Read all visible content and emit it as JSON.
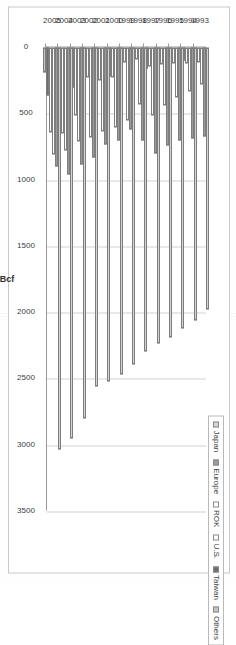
{
  "chart_data": {
    "type": "bar",
    "orientation": "horizontal-grouped",
    "title": "",
    "xlabel": "Bcf",
    "ylabel": "",
    "axis_title": "Bcf",
    "xlim": [
      0,
      3500
    ],
    "xticks": [
      0,
      500,
      1000,
      1500,
      2000,
      2500,
      3000,
      3500
    ],
    "xticklabels": [
      "0",
      "500",
      "1000",
      "1500",
      "2000",
      "2500",
      "3000",
      "3500"
    ],
    "grid": true,
    "axis_reversed": true,
    "legend_position": "top-right",
    "categories": [
      "1993",
      "1994",
      "1995",
      "1996",
      "1997",
      "1998",
      "1999",
      "2000",
      "2001",
      "2002",
      "2003",
      "2004",
      "2005"
    ],
    "series": [
      {
        "name": "Japan",
        "color": "#d4d4d4",
        "values": [
          1980,
          2060,
          2120,
          2190,
          2230,
          2290,
          2390,
          2470,
          2520,
          2560,
          2800,
          2950,
          3030
        ]
      },
      {
        "name": "Europe",
        "color": "#9b9b9b",
        "values": [
          670,
          690,
          700,
          740,
          800,
          700,
          620,
          700,
          730,
          830,
          880,
          960,
          900
        ]
      },
      {
        "name": "ROK",
        "color": "#ffffff",
        "values": [
          280,
          330,
          380,
          440,
          510,
          430,
          550,
          600,
          630,
          680,
          710,
          780,
          810
        ]
      },
      {
        "name": "U.S.",
        "color": "#ffffff",
        "values": [
          110,
          120,
          120,
          130,
          140,
          90,
          110,
          230,
          250,
          230,
          510,
          650,
          640
        ]
      },
      {
        "name": "Taiwan",
        "color": "#6d6d6d",
        "values": [
          70,
          100,
          120,
          140,
          160,
          170,
          180,
          220,
          250,
          270,
          300,
          320,
          360
        ]
      },
      {
        "name": "Others",
        "color": "#c4c4c4",
        "values": [
          30,
          30,
          30,
          40,
          40,
          40,
          40,
          50,
          60,
          60,
          90,
          120,
          190
        ]
      }
    ]
  },
  "legend": {
    "items": [
      {
        "label": "Japan",
        "swatch": "legend-swatch-japan"
      },
      {
        "label": "Europe",
        "swatch": "legend-swatch-europe"
      },
      {
        "label": "ROK",
        "swatch": "legend-swatch-rok"
      },
      {
        "label": "U.S.",
        "swatch": "legend-swatch-us"
      },
      {
        "label": "Taiwan",
        "swatch": "legend-swatch-taiwan"
      },
      {
        "label": "Others",
        "swatch": "legend-swatch-others"
      }
    ]
  }
}
